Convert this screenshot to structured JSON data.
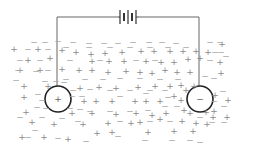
{
  "diagram": {
    "colors": {
      "wire": "#666666",
      "electrode": "#222222",
      "ion_pos": "#8a8a8a",
      "ion_neg": "#a8a8a8"
    },
    "battery": {
      "label": "battery",
      "x": 129,
      "y": 17
    },
    "wires": {
      "left_x": 57,
      "right_x": 199,
      "top_y": 17
    },
    "electrodes": [
      {
        "name": "anode",
        "symbol": "+",
        "cx": 58,
        "cy": 99,
        "r": 13
      },
      {
        "name": "cathode",
        "symbol": "−",
        "cx": 200,
        "cy": 99,
        "r": 13
      }
    ],
    "ions": {
      "positive": [
        [
          14,
          49
        ],
        [
          38,
          49
        ],
        [
          62,
          50
        ],
        [
          76,
          52
        ],
        [
          91,
          54
        ],
        [
          105,
          53
        ],
        [
          122,
          52
        ],
        [
          141,
          51
        ],
        [
          154,
          51
        ],
        [
          170,
          51
        ],
        [
          183,
          51
        ],
        [
          196,
          51
        ],
        [
          208,
          52
        ],
        [
          222,
          44
        ],
        [
          28,
          60
        ],
        [
          50,
          58
        ],
        [
          92,
          61
        ],
        [
          109,
          61
        ],
        [
          124,
          61
        ],
        [
          146,
          61
        ],
        [
          161,
          62
        ],
        [
          174,
          62
        ],
        [
          188,
          59
        ],
        [
          200,
          58
        ],
        [
          220,
          62
        ],
        [
          20,
          70
        ],
        [
          40,
          70
        ],
        [
          62,
          69
        ],
        [
          79,
          70
        ],
        [
          92,
          70
        ],
        [
          108,
          72
        ],
        [
          126,
          71
        ],
        [
          140,
          72
        ],
        [
          152,
          73
        ],
        [
          165,
          70
        ],
        [
          177,
          72
        ],
        [
          190,
          72
        ],
        [
          221,
          73
        ],
        [
          24,
          86
        ],
        [
          48,
          86
        ],
        [
          80,
          88
        ],
        [
          99,
          87
        ],
        [
          116,
          88
        ],
        [
          138,
          87
        ],
        [
          155,
          86
        ],
        [
          170,
          86
        ],
        [
          181,
          85
        ],
        [
          186,
          90
        ],
        [
          194,
          86
        ],
        [
          24,
          97
        ],
        [
          84,
          101
        ],
        [
          96,
          101
        ],
        [
          112,
          101
        ],
        [
          135,
          101
        ],
        [
          146,
          101
        ],
        [
          160,
          101
        ],
        [
          174,
          96
        ],
        [
          181,
          100
        ],
        [
          215,
          95
        ],
        [
          228,
          100
        ],
        [
          26,
          112
        ],
        [
          72,
          113
        ],
        [
          92,
          113
        ],
        [
          116,
          114
        ],
        [
          136,
          113
        ],
        [
          152,
          115
        ],
        [
          166,
          113
        ],
        [
          184,
          110
        ],
        [
          190,
          113
        ],
        [
          199,
          112
        ],
        [
          206,
          112
        ],
        [
          214,
          111
        ],
        [
          32,
          122
        ],
        [
          54,
          124
        ],
        [
          83,
          124
        ],
        [
          108,
          123
        ],
        [
          131,
          123
        ],
        [
          140,
          122
        ],
        [
          160,
          119
        ],
        [
          182,
          121
        ],
        [
          196,
          123
        ],
        [
          213,
          117
        ],
        [
          227,
          117
        ],
        [
          22,
          137
        ],
        [
          44,
          137
        ],
        [
          68,
          139
        ],
        [
          97,
          133
        ],
        [
          112,
          132
        ],
        [
          148,
          132
        ],
        [
          174,
          131
        ],
        [
          193,
          131
        ],
        [
          207,
          124
        ]
      ],
      "negative": [
        [
          34,
          42
        ],
        [
          45,
          42
        ],
        [
          58,
          41
        ],
        [
          73,
          42
        ],
        [
          89,
          43
        ],
        [
          104,
          43
        ],
        [
          118,
          43
        ],
        [
          133,
          42
        ],
        [
          149,
          42
        ],
        [
          162,
          42
        ],
        [
          176,
          43
        ],
        [
          210,
          42
        ],
        [
          220,
          42
        ],
        [
          28,
          49
        ],
        [
          48,
          49
        ],
        [
          66,
          47
        ],
        [
          89,
          47
        ],
        [
          110,
          47
        ],
        [
          130,
          47
        ],
        [
          150,
          47
        ],
        [
          168,
          47
        ],
        [
          186,
          47
        ],
        [
          215,
          52
        ],
        [
          221,
          52
        ],
        [
          20,
          60
        ],
        [
          40,
          60
        ],
        [
          70,
          60
        ],
        [
          100,
          60
        ],
        [
          136,
          60
        ],
        [
          155,
          60
        ],
        [
          210,
          60
        ],
        [
          226,
          56
        ],
        [
          18,
          70
        ],
        [
          36,
          71
        ],
        [
          48,
          70
        ],
        [
          66,
          79
        ],
        [
          85,
          79
        ],
        [
          103,
          79
        ],
        [
          120,
          78
        ],
        [
          140,
          78
        ],
        [
          160,
          79
        ],
        [
          178,
          79
        ],
        [
          205,
          76
        ],
        [
          214,
          78
        ],
        [
          16,
          80
        ],
        [
          45,
          81
        ],
        [
          56,
          81
        ],
        [
          64,
          82
        ],
        [
          73,
          90
        ],
        [
          90,
          89
        ],
        [
          110,
          90
        ],
        [
          130,
          90
        ],
        [
          150,
          90
        ],
        [
          165,
          90
        ],
        [
          211,
          92
        ],
        [
          223,
          91
        ],
        [
          38,
          94
        ],
        [
          42,
          100
        ],
        [
          72,
          96
        ],
        [
          82,
          96
        ],
        [
          120,
          96
        ],
        [
          146,
          93
        ],
        [
          168,
          97
        ],
        [
          214,
          101
        ],
        [
          224,
          106
        ],
        [
          37,
          107
        ],
        [
          46,
          108
        ],
        [
          70,
          108
        ],
        [
          80,
          109
        ],
        [
          90,
          111
        ],
        [
          110,
          111
        ],
        [
          130,
          111
        ],
        [
          148,
          110
        ],
        [
          165,
          106
        ],
        [
          177,
          106
        ],
        [
          224,
          122
        ],
        [
          20,
          117
        ],
        [
          42,
          117
        ],
        [
          62,
          118
        ],
        [
          78,
          121
        ],
        [
          120,
          121
        ],
        [
          150,
          121
        ],
        [
          170,
          121
        ],
        [
          200,
          117
        ],
        [
          212,
          122
        ],
        [
          28,
          137
        ],
        [
          35,
          130
        ],
        [
          58,
          138
        ],
        [
          86,
          141
        ],
        [
          118,
          136
        ],
        [
          145,
          140
        ],
        [
          172,
          140
        ],
        [
          190,
          140
        ],
        [
          200,
          142
        ]
      ]
    }
  }
}
